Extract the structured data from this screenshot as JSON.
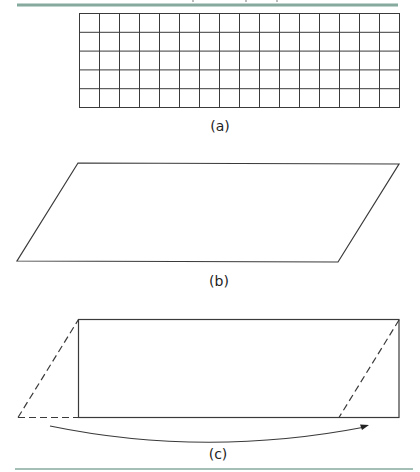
{
  "colors": {
    "rule": "#86aa9e",
    "stroke": "#3a3a3a",
    "text": "#222222"
  },
  "figure_a": {
    "label": "(a)",
    "grid": {
      "columns": 16,
      "rows": 5
    }
  },
  "figure_b": {
    "label": "(b)",
    "shape": "parallelogram"
  },
  "figure_c": {
    "label": "(c)",
    "shape": "rectangle with dashed triangle moved from left to right",
    "arrow": "curved-arrow-left-to-right"
  }
}
